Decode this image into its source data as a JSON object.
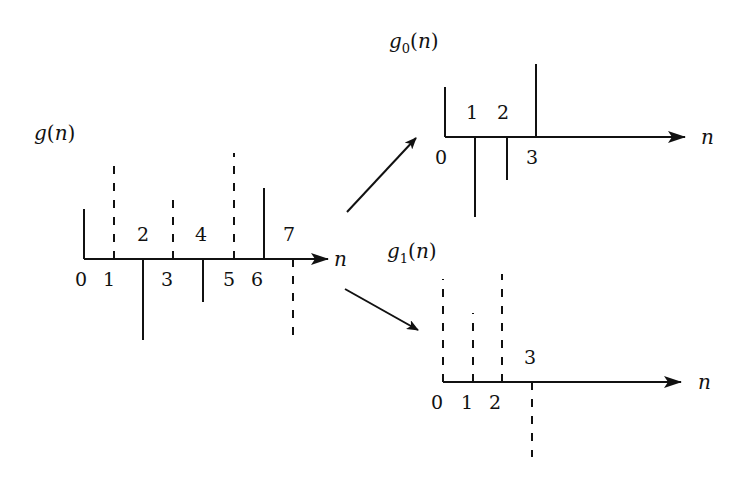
{
  "diagram": {
    "stroke_color": "#111111",
    "background": "#ffffff",
    "graphs": [
      {
        "id": "g",
        "title": {
          "base": "g",
          "sub": "",
          "arg": "n"
        },
        "axis_label": "n",
        "axis": {
          "x0": 84,
          "y": 259,
          "x_end": 328
        },
        "title_pos": {
          "x": 34,
          "y": 140
        },
        "samples": [
          {
            "n": 0,
            "x": 84,
            "y_end": 209,
            "style": "solid",
            "label": "0",
            "label_pos": "below",
            "lx": 81,
            "ly": 286
          },
          {
            "n": 1,
            "x": 114,
            "y_end": 158,
            "style": "dashed",
            "label": "1",
            "label_pos": "below",
            "lx": 109,
            "ly": 286
          },
          {
            "n": 2,
            "x": 143,
            "y_end": 340,
            "style": "solid",
            "label": "2",
            "label_pos": "above",
            "lx": 143,
            "ly": 241
          },
          {
            "n": 3,
            "x": 173,
            "y_end": 193,
            "style": "dashed",
            "label": "3",
            "label_pos": "below",
            "lx": 167,
            "ly": 286
          },
          {
            "n": 4,
            "x": 203,
            "y_end": 302,
            "style": "solid",
            "label": "4",
            "label_pos": "above",
            "lx": 201,
            "ly": 241
          },
          {
            "n": 5,
            "x": 234,
            "y_end": 153,
            "style": "dashed",
            "label": "5",
            "label_pos": "below",
            "lx": 229,
            "ly": 286
          },
          {
            "n": 6,
            "x": 264,
            "y_end": 188,
            "style": "solid",
            "label": "6",
            "label_pos": "below",
            "lx": 257,
            "ly": 286
          },
          {
            "n": 7,
            "x": 293,
            "y_end": 337,
            "style": "dashed",
            "label": "7",
            "label_pos": "above",
            "lx": 289,
            "ly": 241
          }
        ],
        "n_label_pos": {
          "x": 334,
          "y": 266
        }
      },
      {
        "id": "g0",
        "title": {
          "base": "g",
          "sub": "0",
          "arg": "n"
        },
        "axis_label": "n",
        "axis": {
          "x0": 445,
          "y": 137,
          "x_end": 685
        },
        "title_pos": {
          "x": 389,
          "y": 48
        },
        "samples": [
          {
            "n": 0,
            "x": 445,
            "y_end": 87,
            "style": "solid",
            "label": "0",
            "label_pos": "below",
            "lx": 441,
            "ly": 164
          },
          {
            "n": 1,
            "x": 475,
            "y_end": 217,
            "style": "solid",
            "label": "1",
            "label_pos": "above",
            "lx": 472,
            "ly": 119
          },
          {
            "n": 2,
            "x": 507,
            "y_end": 180,
            "style": "solid",
            "label": "2",
            "label_pos": "above",
            "lx": 503,
            "ly": 119
          },
          {
            "n": 3,
            "x": 536,
            "y_end": 64,
            "style": "solid",
            "label": "3",
            "label_pos": "below",
            "lx": 532,
            "ly": 164
          }
        ],
        "n_label_pos": {
          "x": 701,
          "y": 144
        }
      },
      {
        "id": "g1",
        "title": {
          "base": "g",
          "sub": "1",
          "arg": "n"
        },
        "axis_label": "n",
        "axis": {
          "x0": 443,
          "y": 382,
          "x_end": 681
        },
        "title_pos": {
          "x": 387,
          "y": 258
        },
        "samples": [
          {
            "n": 0,
            "x": 443,
            "y_end": 279,
            "style": "dashed",
            "label": "0",
            "label_pos": "below",
            "lx": 437,
            "ly": 409
          },
          {
            "n": 1,
            "x": 473,
            "y_end": 313,
            "style": "dashed",
            "label": "1",
            "label_pos": "below",
            "lx": 467,
            "ly": 409
          },
          {
            "n": 2,
            "x": 502,
            "y_end": 274,
            "style": "dashed",
            "label": "2",
            "label_pos": "below",
            "lx": 495,
            "ly": 409
          },
          {
            "n": 3,
            "x": 532,
            "y_end": 457,
            "style": "dashed",
            "label": "3",
            "label_pos": "above",
            "lx": 530,
            "ly": 364
          }
        ],
        "n_label_pos": {
          "x": 698,
          "y": 389
        }
      }
    ],
    "arrows": [
      {
        "name": "to-g0",
        "x1": 347,
        "y1": 212,
        "x2": 416,
        "y2": 138
      },
      {
        "name": "to-g1",
        "x1": 345,
        "y1": 289,
        "x2": 418,
        "y2": 330
      }
    ]
  }
}
